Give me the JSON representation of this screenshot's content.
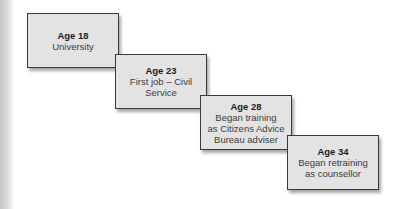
{
  "diagram": {
    "type": "career-timeline-staircase",
    "stages": [
      {
        "age": "Age 18",
        "description": "University"
      },
      {
        "age": "Age 23",
        "description": "First job – Civil\nService"
      },
      {
        "age": "Age 28",
        "description": "Began training\nas Citizens Advice\nBureau adviser"
      },
      {
        "age": "Age 34",
        "description": "Began retraining\nas counsellor"
      }
    ],
    "colors": {
      "box_fill": "#e3e3e3",
      "box_border": "#3a3a3a",
      "age_text": "#1e1e1e",
      "desc_text": "#3c3c3c"
    }
  }
}
